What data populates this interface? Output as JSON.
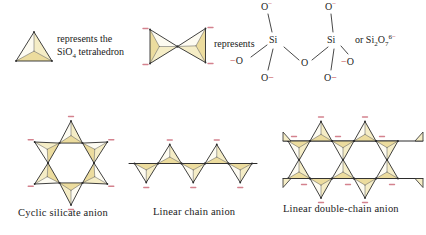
{
  "colors": {
    "background": "#ffffff",
    "text": "#1a1a1a",
    "outline": "#2b2b2b",
    "inner_line": "#555555",
    "tetrahedron_light": "#fdfbf1",
    "tetrahedron_mid": "#f5edc6",
    "tetrahedron_dark": "#ecdc9e",
    "charge_dash": "#d4828e",
    "charge_text": "#c03a3a"
  },
  "legend_single": {
    "line1": "represents the",
    "formula_base": "SiO",
    "formula_sub": "4",
    "line2_rest": " tetrahedron"
  },
  "legend_pair": {
    "label": "represents"
  },
  "formula": {
    "top_left_o": "O",
    "top_left_charge": "−",
    "top_right_o": "O",
    "top_right_charge": "−",
    "si_left": "Si",
    "si_right": "Si",
    "bridging_o": "O",
    "left_terminal_charge": "−",
    "left_terminal_o": "O",
    "right_terminal_charge": "−",
    "right_terminal_o": "O",
    "bottom_left_o": "O",
    "bottom_left_charge": "−",
    "bottom_right_o": "O",
    "bottom_right_charge": "−",
    "alt_prefix": "or Si",
    "alt_sub1": "2",
    "alt_o": "O",
    "alt_sub2": "7",
    "alt_sup_num": "6",
    "alt_sup_minus": "−"
  },
  "captions": {
    "cyclic": "Cyclic silicate anion",
    "linear": "Linear chain anion",
    "double": "Linear double-chain anion"
  },
  "diagram": {
    "cyclic_tetrahedra_count": 6,
    "linear_chain_tetrahedra_count": 5,
    "double_chain_hexagonal_rings": 2
  }
}
